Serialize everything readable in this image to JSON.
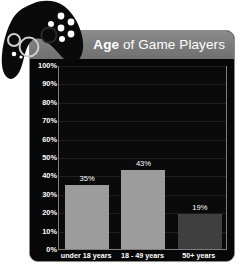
{
  "header": {
    "title_strong": "Age",
    "title_rest": " of Game Players"
  },
  "icons": {
    "gamepad": "gamepad-icon"
  },
  "colors": {
    "panel_bg": "#0c0c0c",
    "panel_border": "#8a8a8a",
    "header_bg": "#7b7b7b",
    "plot_bg": "#0a0a0a",
    "axis_line": "#7e7e7e",
    "gridline": "#1e1e1e",
    "bar_light": "#9c9c9c",
    "bar_dark": "#3f3f3f",
    "text": "#ffffff"
  },
  "chart_data": {
    "type": "bar",
    "title": "Age of Game Players",
    "xlabel": "",
    "ylabel": "",
    "ylim": [
      0,
      100
    ],
    "grid": true,
    "legend": "none",
    "categories": [
      "under 18 years",
      "18 - 49 years",
      "50+ years"
    ],
    "values": [
      35,
      43,
      19
    ],
    "value_labels": [
      "35%",
      "43%",
      "19%"
    ],
    "bar_colors": [
      "#9c9c9c",
      "#9c9c9c",
      "#3f3f3f"
    ],
    "ytick_labels": [
      "100%",
      "90%",
      "80%",
      "70%",
      "60%",
      "50%",
      "40%",
      "30%",
      "20%",
      "10%",
      "0%"
    ],
    "ytick_values": [
      100,
      90,
      80,
      70,
      60,
      50,
      40,
      30,
      20,
      10,
      0
    ]
  }
}
